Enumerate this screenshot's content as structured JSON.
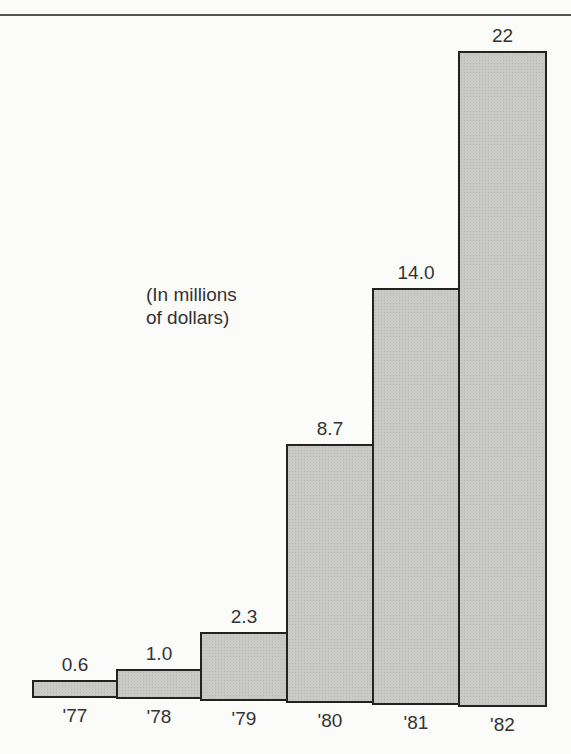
{
  "chart_data": {
    "type": "bar",
    "title": "",
    "xlabel": "",
    "ylabel": "",
    "annotation": "(In millions\nof dollars)",
    "categories": [
      "'77",
      "'78",
      "'79",
      "'80",
      "'81",
      "'82"
    ],
    "values": [
      0.6,
      1.0,
      2.3,
      8.7,
      14.0,
      22
    ],
    "value_labels": [
      "0.6",
      "1.0",
      "2.3",
      "8.7",
      "14.0",
      "22"
    ],
    "ylim": [
      0,
      22
    ],
    "grid": false,
    "legend": "none",
    "bar_color": "#c9c9c7",
    "border_color": "#222222"
  }
}
